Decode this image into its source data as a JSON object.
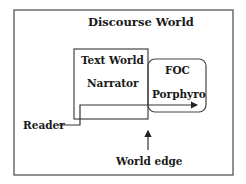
{
  "diagram": {
    "outer_box": {
      "label": "Discourse World"
    },
    "text_world_box": {
      "label": "Text World",
      "sublabel": "Narrator"
    },
    "foc_box": {
      "label": "FOC",
      "sublabel": "Porphyro"
    },
    "reader": {
      "label": "Reader"
    },
    "world_edge": {
      "label": "World edge"
    },
    "colors": {
      "line": "#444444",
      "text": "#1a1a1a",
      "background": "#ffffff"
    }
  }
}
